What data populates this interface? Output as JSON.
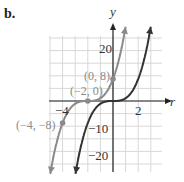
{
  "part_label": "b.",
  "chart_data": {
    "type": "line",
    "title": "",
    "xlabel": "r",
    "ylabel": "y",
    "xlim": [
      -5,
      2.5
    ],
    "ylim": [
      -25,
      25
    ],
    "grid": true,
    "x_ticks": [
      {
        "value": -4,
        "label": "−4"
      },
      {
        "value": 2,
        "label": "2"
      }
    ],
    "y_ticks": [
      {
        "value": 20,
        "label": "20"
      },
      {
        "value": -10,
        "label": "−10"
      },
      {
        "value": -20,
        "label": "−20"
      }
    ],
    "series": [
      {
        "name": "y = x^3",
        "color": "#333333",
        "function": "x^3"
      },
      {
        "name": "y = (x+2)^3",
        "color": "#8a8a8a",
        "function": "(x+2)^3"
      }
    ],
    "points": [
      {
        "x": -4,
        "y": -8,
        "label": "(−4, −8)"
      },
      {
        "x": -2,
        "y": 0,
        "label": "(−2, 0)"
      },
      {
        "x": 0,
        "y": 8,
        "label": "(0, 8)"
      }
    ]
  }
}
